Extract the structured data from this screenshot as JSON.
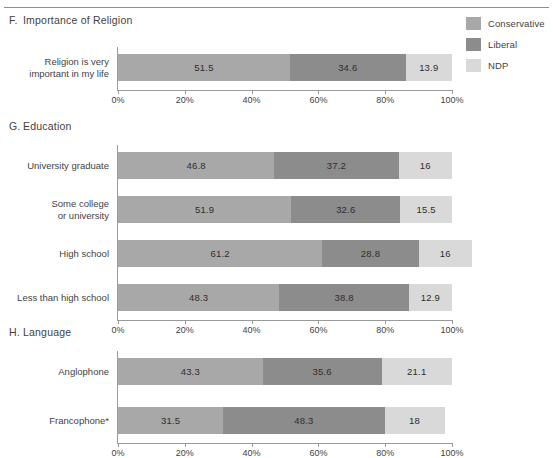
{
  "legend": {
    "items": [
      {
        "label": "Conservative",
        "color": "#a8a8a8",
        "icon": "legend-swatch-icon"
      },
      {
        "label": "Liberal",
        "color": "#8c8c8c",
        "icon": "legend-swatch-icon"
      },
      {
        "label": "NDP",
        "color": "#d9d9d9",
        "icon": "legend-swatch-icon"
      }
    ]
  },
  "axis": {
    "ticks": [
      "0%",
      "20%",
      "40%",
      "60%",
      "80%",
      "100%"
    ],
    "tick_values": [
      0,
      20,
      40,
      60,
      80,
      100
    ]
  },
  "panels": [
    {
      "letter": "F.",
      "title": "Importance of Religion",
      "rows": [
        {
          "label": "Religion is very\nimportant in my life",
          "values": [
            51.5,
            34.6,
            13.9
          ]
        }
      ]
    },
    {
      "letter": "G.",
      "title": "Education",
      "rows": [
        {
          "label": "University graduate",
          "values": [
            46.8,
            37.2,
            16
          ]
        },
        {
          "label": "Some college\nor university",
          "values": [
            51.9,
            32.6,
            15.5
          ]
        },
        {
          "label": "High school",
          "values": [
            61.2,
            28.8,
            16
          ]
        },
        {
          "label": "Less than high school",
          "values": [
            48.3,
            38.8,
            12.9
          ]
        }
      ]
    },
    {
      "letter": "H.",
      "title": "Language",
      "rows": [
        {
          "label": "Anglophone",
          "values": [
            43.3,
            35.6,
            21.1
          ]
        },
        {
          "label": "Francophone*",
          "values": [
            31.5,
            48.3,
            18
          ]
        }
      ]
    }
  ],
  "chart_data": {
    "type": "bar",
    "subtype": "horizontal-stacked-percentage",
    "title": "",
    "xlabel": "",
    "ylabel": "",
    "xlim": [
      0,
      100
    ],
    "grid": false,
    "legend_position": "top-right",
    "series": [
      {
        "name": "Conservative",
        "color": "#a8a8a8"
      },
      {
        "name": "Liberal",
        "color": "#8c8c8c"
      },
      {
        "name": "NDP",
        "color": "#d9d9d9"
      }
    ],
    "panels": [
      {
        "id": "F",
        "title": "Importance of Religion",
        "categories": [
          "Religion is very important in my life"
        ],
        "values": {
          "Conservative": [
            51.5
          ],
          "Liberal": [
            34.6
          ],
          "NDP": [
            13.9
          ]
        }
      },
      {
        "id": "G",
        "title": "Education",
        "categories": [
          "University graduate",
          "Some college or university",
          "High school",
          "Less than high school"
        ],
        "values": {
          "Conservative": [
            46.8,
            51.9,
            61.2,
            48.3
          ],
          "Liberal": [
            37.2,
            32.6,
            28.8,
            38.8
          ],
          "NDP": [
            16,
            15.5,
            16,
            12.9
          ]
        }
      },
      {
        "id": "H",
        "title": "Language",
        "categories": [
          "Anglophone",
          "Francophone*"
        ],
        "values": {
          "Conservative": [
            43.3,
            31.5
          ],
          "Liberal": [
            35.6,
            48.3
          ],
          "NDP": [
            21.1,
            18
          ]
        }
      }
    ],
    "xticks": [
      0,
      20,
      40,
      60,
      80,
      100
    ],
    "xticklabels": [
      "0%",
      "20%",
      "40%",
      "60%",
      "80%",
      "100%"
    ]
  }
}
